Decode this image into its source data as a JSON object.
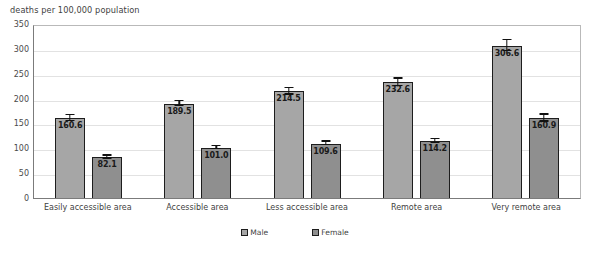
{
  "chart_data": {
    "type": "bar",
    "title": "",
    "ylabel": "deaths per 100,000 population",
    "xlabel": "",
    "ylim": [
      0,
      350
    ],
    "yticks": [
      0,
      50,
      100,
      150,
      200,
      250,
      300,
      350
    ],
    "grid": true,
    "legend_position": "bottom",
    "categories": [
      "Easily accessible area",
      "Accessible area",
      "Less accessible area",
      "Remote area",
      "Very remote area"
    ],
    "series": [
      {
        "name": "Male",
        "color": "#a6a6a6",
        "values": [
          160.6,
          189.5,
          214.5,
          232.6,
          306.6
        ],
        "labels": [
          "160.6",
          "189.5",
          "214.5",
          "232.6",
          "306.6"
        ],
        "errors": [
          6.0,
          5.0,
          6.5,
          7.5,
          11.0
        ]
      },
      {
        "name": "Female",
        "color": "#8f8f8f",
        "values": [
          82.1,
          101.0,
          109.6,
          114.2,
          160.9
        ],
        "labels": [
          "82.1",
          "101.0",
          "109.6",
          "114.2",
          "160.9"
        ],
        "errors": [
          3.0,
          3.0,
          3.5,
          4.0,
          7.0
        ]
      }
    ]
  },
  "note": {
    "text": ""
  }
}
